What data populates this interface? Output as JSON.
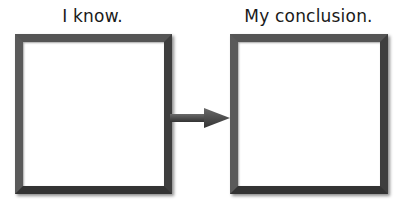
{
  "diagram": {
    "left": {
      "label": "I know.",
      "content": ""
    },
    "right": {
      "label": "My conclusion.",
      "content": ""
    },
    "connector": {
      "type": "arrow",
      "direction": "right",
      "color": "#4a4a4a"
    }
  }
}
